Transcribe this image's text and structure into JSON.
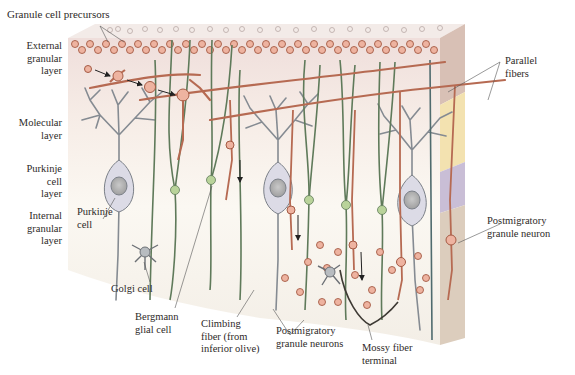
{
  "figure": {
    "colors": {
      "front_top": "#f3e6e2",
      "front_mid": "#faf6ef",
      "front_bottom": "#f4efe6",
      "side_top": "#d8c0b5",
      "side_molecular": "#f3e2b0",
      "side_purkinje": "#c9bed6",
      "side_internal": "#dccdbd",
      "granule": "#e9a98f",
      "granule_stroke": "#a45a44",
      "purkinje_cell": "#d9d8e4",
      "purkinje_stroke": "#7b8088",
      "bergmann_glia": "#5f7a5a",
      "glia_soma": "#b9d39a",
      "parallel_fiber": "#b66a52",
      "climbing_fiber": "#4f6b6e",
      "golgi_cell": "#9a9ea3",
      "arrow": "#222222",
      "leader_line": "#555555"
    }
  },
  "layers": [
    {
      "id": "external",
      "lines": [
        "External",
        "granular",
        "layer"
      ]
    },
    {
      "id": "molecular",
      "lines": [
        "Molecular",
        "layer"
      ]
    },
    {
      "id": "purkinje",
      "lines": [
        "Purkinje",
        "cell",
        "layer"
      ]
    },
    {
      "id": "internal",
      "lines": [
        "Internal",
        "granular",
        "layer"
      ]
    }
  ],
  "labels": {
    "granule_cell_precursors": "Granule cell precursors",
    "parallel_fibers": [
      "Parallel",
      "fibers"
    ],
    "purkinje_cell": [
      "Purkinje",
      "cell"
    ],
    "postmigratory_granule_neuron": [
      "Postmigratory",
      "granule neuron"
    ],
    "golgi_cell": "Golgi cell",
    "bergmann_glial_cell": [
      "Bergmann",
      "glial cell"
    ],
    "climbing_fiber": [
      "Climbing",
      "fiber (from",
      "inferior olive)"
    ],
    "postmigratory_granule_neurons": [
      "Postmigratory",
      "granule neurons"
    ],
    "mossy_fiber_terminal": [
      "Mossy fiber",
      "terminal"
    ]
  }
}
